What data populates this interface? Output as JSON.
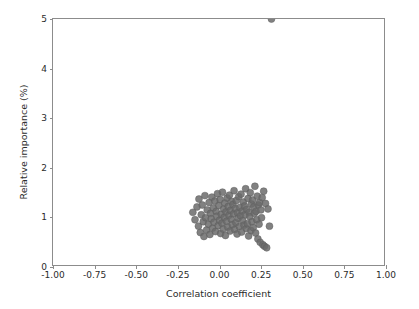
{
  "chart_data": {
    "type": "scatter",
    "title": "",
    "xlabel": "Correlation coefficient",
    "ylabel": "Relative importance (%)",
    "xlim": [
      -1.0,
      1.0
    ],
    "ylim": [
      0,
      5
    ],
    "xticks": [
      -1.0,
      -0.75,
      -0.5,
      -0.25,
      0.0,
      0.25,
      0.5,
      0.75,
      1.0
    ],
    "xticklabels": [
      "-1.00",
      "-0.75",
      "-0.50",
      "-0.25",
      "0.00",
      "0.25",
      "0.50",
      "0.75",
      "1.00"
    ],
    "yticks": [
      0,
      1,
      2,
      3,
      4,
      5
    ],
    "yticklabels": [
      "0",
      "1",
      "2",
      "3",
      "4",
      "5"
    ],
    "grid": false,
    "legend": null,
    "marker": {
      "shape": "circle",
      "color": "#6b6b6b",
      "edge_color": "#5f5f5f",
      "size_px": 7,
      "alpha": 0.85
    },
    "point_count": 112,
    "x": [
      -0.155,
      -0.142,
      -0.13,
      -0.121,
      -0.118,
      -0.11,
      -0.104,
      -0.098,
      -0.092,
      -0.088,
      -0.082,
      -0.078,
      -0.072,
      -0.068,
      -0.061,
      -0.057,
      -0.052,
      -0.048,
      -0.044,
      -0.04,
      -0.035,
      -0.031,
      -0.027,
      -0.022,
      -0.018,
      -0.014,
      -0.01,
      -0.006,
      -0.002,
      0.002,
      0.006,
      0.01,
      0.013,
      0.017,
      0.021,
      0.024,
      0.028,
      0.031,
      0.035,
      0.038,
      0.042,
      0.045,
      0.049,
      0.052,
      0.056,
      0.059,
      0.063,
      0.066,
      0.07,
      0.073,
      0.077,
      0.08,
      0.084,
      0.087,
      0.091,
      0.094,
      0.098,
      0.101,
      0.105,
      0.108,
      0.112,
      0.115,
      0.119,
      0.122,
      0.126,
      0.129,
      0.133,
      0.136,
      0.14,
      0.143,
      0.147,
      0.15,
      0.154,
      0.157,
      0.161,
      0.164,
      0.168,
      0.171,
      0.175,
      0.178,
      0.182,
      0.185,
      0.189,
      0.192,
      0.196,
      0.199,
      0.203,
      0.206,
      0.21,
      0.213,
      0.217,
      0.22,
      0.224,
      0.227,
      0.231,
      0.234,
      0.238,
      0.241,
      0.245,
      0.248,
      0.252,
      0.256,
      0.26,
      0.264,
      0.268,
      0.273,
      0.278,
      0.284,
      0.291,
      0.299,
      0.308,
      0.32
    ],
    "y": [
      1.07,
      0.92,
      1.18,
      0.79,
      1.34,
      0.66,
      1.02,
      1.22,
      0.88,
      0.58,
      1.41,
      0.96,
      0.71,
      1.12,
      0.83,
      1.27,
      0.62,
      1.05,
      0.94,
      1.38,
      0.75,
      1.16,
      0.87,
      1.3,
      0.68,
      1.09,
      0.99,
      1.45,
      0.8,
      1.21,
      0.91,
      1.33,
      0.64,
      1.03,
      0.85,
      1.48,
      0.73,
      1.14,
      0.97,
      1.26,
      0.6,
      1.08,
      0.89,
      1.36,
      0.77,
      1.19,
      1.01,
      1.42,
      0.69,
      1.11,
      0.93,
      1.29,
      0.82,
      1.23,
      1.04,
      1.51,
      0.72,
      1.15,
      0.86,
      1.31,
      0.63,
      1.06,
      0.95,
      1.39,
      0.78,
      1.17,
      1.0,
      1.44,
      0.67,
      1.1,
      0.9,
      1.28,
      0.81,
      1.2,
      1.02,
      1.55,
      0.74,
      1.13,
      0.84,
      1.35,
      0.59,
      1.07,
      0.98,
      1.47,
      0.7,
      1.24,
      0.88,
      1.32,
      0.76,
      1.18,
      1.05,
      1.6,
      0.65,
      1.09,
      0.92,
      1.4,
      0.53,
      1.22,
      0.83,
      1.27,
      0.46,
      1.12,
      0.96,
      1.37,
      0.41,
      1.5,
      0.38,
      1.25,
      0.35,
      1.14,
      0.79
    ]
  },
  "axes": {
    "x_tick_labels": [
      "-1.00",
      "-0.75",
      "-0.50",
      "-0.25",
      "0.00",
      "0.25",
      "0.50",
      "0.75",
      "1.00"
    ],
    "y_tick_labels": [
      "0",
      "1",
      "2",
      "3",
      "4",
      "5"
    ],
    "x_title": "Correlation coefficient",
    "y_title": "Relative importance (%)"
  },
  "style": {
    "background": "#ffffff",
    "axis_color": "#8c8c8c",
    "text_color": "#2b2b2b",
    "point_color": "#6b6b6b"
  }
}
